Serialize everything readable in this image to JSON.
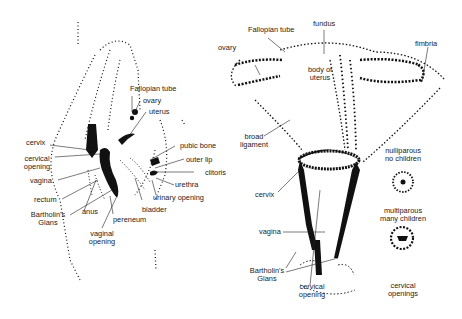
{
  "left_diagram": {
    "title": "side view of female reproductive anatomy",
    "labels": {
      "fallopian_tube": "Fallopian tube",
      "ovary": "ovary",
      "uterus": "uterus",
      "cervix": "cervix",
      "cervical_opening_1": "cervical",
      "cervical_opening_2": "opening",
      "vagina": "vagina",
      "rectum": "rectum",
      "bartholins_1": "Bartholin's",
      "bartholins_2": "Glans",
      "anus": "anus",
      "vaginal_opening_1": "vaginal",
      "vaginal_opening_2": "opening",
      "pereneum": "pereneum",
      "bladder": "bladder",
      "pubic_bone": "pubic bone",
      "outer_lip": "outer lip",
      "clitoris": "clitoris",
      "urethra": "urethra",
      "urinary_opening": "urinary opening"
    }
  },
  "right_diagram": {
    "title": "front view of uterus",
    "labels": {
      "fallopian_tube": "Fallopian tube",
      "fundus": "fundus",
      "ovary": "ovary",
      "fimbria": "fimbria",
      "body_of_uterus_1": "body of",
      "body_of_uterus_2": "uterus",
      "broad_ligament_1": "broad",
      "broad_ligament_2": "ligament",
      "cervix": "cervix",
      "vagina": "vagina",
      "bartholins_1": "Bartholin's",
      "bartholins_2": "Glans",
      "cervical_opening_1": "cervical",
      "cervical_opening_2": "opening"
    }
  },
  "cervical_openings": {
    "nulliparous_1": "nulliparous",
    "nulliparous_2": "no children",
    "multiparous_1": "multiparous",
    "multiparous_2": "many children",
    "caption_1": "cervical",
    "caption_2": "openings"
  }
}
